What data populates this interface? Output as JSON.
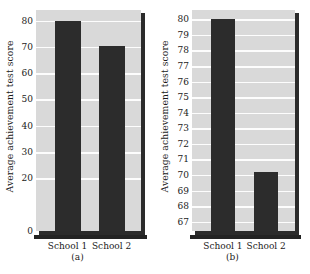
{
  "figure": {
    "background": "#ffffff",
    "bar_color": "#2c2c2c",
    "plot_background": "#d9d9d9",
    "gridline_color": "#fdfdfd",
    "axis_color": "#232323"
  },
  "panels": [
    {
      "caption": "(a)",
      "ylabel": "Average achievement test score",
      "categories": [
        "School 1",
        "School 2"
      ]
    },
    {
      "caption": "(b)",
      "ylabel": "Average achievement test score",
      "categories": [
        "School 1",
        "School 2"
      ]
    }
  ],
  "chart_data": [
    {
      "type": "bar",
      "title": "",
      "panel": "(a)",
      "xlabel": "",
      "ylabel": "Average achievement test score",
      "categories": [
        "School 1",
        "School 2"
      ],
      "values": [
        80,
        70.5
      ],
      "ylim": [
        0,
        84
      ],
      "yticks": [
        0,
        20,
        30,
        40,
        50,
        60,
        70,
        80
      ],
      "ytick_labels": [
        "0",
        "20",
        "30",
        "40",
        "50",
        "60",
        "70",
        "80"
      ],
      "gridlines": [
        20,
        30,
        40,
        50,
        60,
        70,
        80
      ],
      "grid": true,
      "legend": "none",
      "note": "Full y-axis beginning at zero; the difference between schools appears small."
    },
    {
      "type": "bar",
      "title": "",
      "panel": "(b)",
      "xlabel": "",
      "ylabel": "Average achievement test score",
      "categories": [
        "School 1",
        "School 2"
      ],
      "values": [
        80,
        70.2
      ],
      "ylim": [
        66.4,
        80.6
      ],
      "yticks": [
        67,
        68,
        69,
        70,
        71,
        72,
        73,
        74,
        75,
        76,
        77,
        78,
        79,
        80
      ],
      "ytick_labels": [
        "67",
        "68",
        "69",
        "70",
        "71",
        "72",
        "73",
        "74",
        "75",
        "76",
        "77",
        "78",
        "79",
        "80"
      ],
      "gridlines": [
        67,
        68,
        69,
        70,
        71,
        72,
        73,
        74,
        75,
        76,
        77,
        78,
        79,
        80
      ],
      "grid": true,
      "legend": "none",
      "note": "Truncated y-axis starting near 67; the same difference appears dramatically larger."
    }
  ]
}
